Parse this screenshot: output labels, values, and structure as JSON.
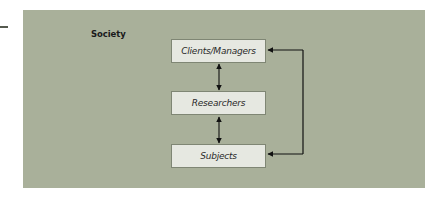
{
  "diagram": {
    "container_label": "Society",
    "nodes": [
      {
        "id": "clients",
        "label": "Clients/Managers"
      },
      {
        "id": "researchers",
        "label": "Researchers"
      },
      {
        "id": "subjects",
        "label": "Subjects"
      }
    ],
    "edges": [
      {
        "from": "clients",
        "to": "researchers",
        "type": "bidirectional"
      },
      {
        "from": "researchers",
        "to": "subjects",
        "type": "bidirectional"
      },
      {
        "from": "clients",
        "to": "subjects",
        "type": "bidirectional",
        "route": "right-side bracket"
      }
    ],
    "colors": {
      "panel_background": "#a9b09a",
      "node_fill": "#e6e8e1",
      "node_border": "#7f8674",
      "arrow": "#111111"
    }
  }
}
